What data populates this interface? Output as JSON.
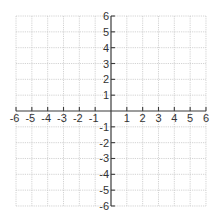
{
  "chart_data": {
    "type": "scatter",
    "title": "",
    "xlabel": "",
    "ylabel": "",
    "xlim": [
      -6,
      6
    ],
    "ylim": [
      -6,
      6
    ],
    "grid": true,
    "x_ticks": [
      -6,
      -5,
      -4,
      -3,
      -2,
      -1,
      1,
      2,
      3,
      4,
      5,
      6
    ],
    "y_ticks": [
      6,
      5,
      4,
      3,
      2,
      1,
      -1,
      -2,
      -3,
      -4,
      -5,
      -6
    ],
    "x_tick_labels": [
      "-6",
      "-5",
      "-4",
      "-3",
      "-2",
      "-1",
      "1",
      "2",
      "3",
      "4",
      "5",
      "6"
    ],
    "y_tick_labels": [
      "6",
      "5",
      "4",
      "3",
      "2",
      "1",
      "-1",
      "-2",
      "-3",
      "-4",
      "-5",
      "-6"
    ],
    "series": []
  },
  "layout": {
    "origin_px": [
      111,
      111
    ],
    "unit_px": 15.83,
    "grid_color": "#c8c8c8",
    "axis_color": "#3a3a3a",
    "label_color": "#333333"
  }
}
